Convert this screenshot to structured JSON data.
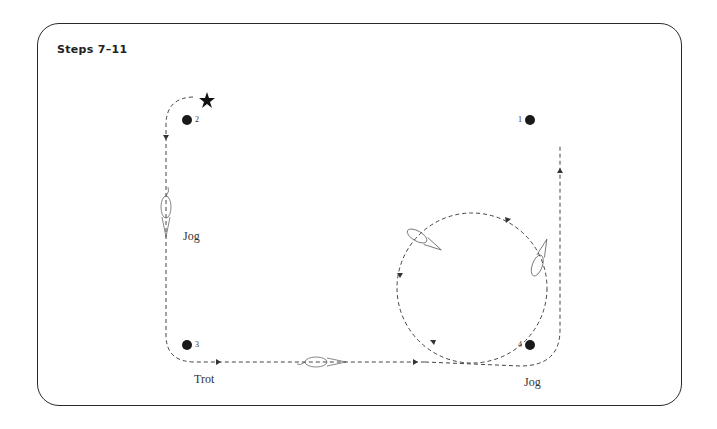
{
  "title": "Steps 7–11",
  "markers": [
    {
      "id": "1",
      "label": "1"
    },
    {
      "id": "2",
      "label": "2"
    },
    {
      "id": "3",
      "label": "3"
    },
    {
      "id": "4",
      "label": "4"
    }
  ],
  "gait_labels": {
    "left_side": "Jog",
    "bottom_left": "Trot",
    "bottom_right": "Jog"
  },
  "start_marker": "star-icon",
  "colors": {
    "line": "#333333",
    "dot": "#1a1a1a",
    "frame": "#2a2a2a"
  }
}
